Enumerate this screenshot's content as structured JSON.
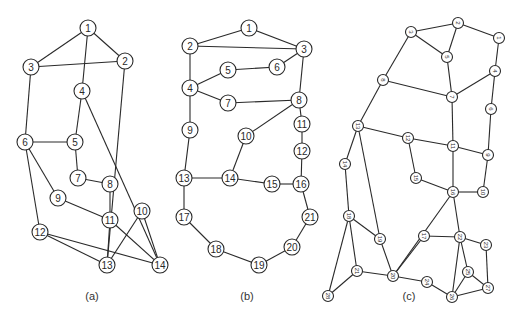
{
  "figure": {
    "panels": [
      {
        "id": "a",
        "caption": "(a)",
        "caption_pos": [
          92,
          300
        ],
        "node_radius": 8,
        "font_size": 10,
        "label_rotation": 0,
        "nodes": [
          {
            "id": "1",
            "x": 88,
            "y": 28
          },
          {
            "id": "2",
            "x": 125,
            "y": 61
          },
          {
            "id": "3",
            "x": 31,
            "y": 67
          },
          {
            "id": "4",
            "x": 82,
            "y": 91
          },
          {
            "id": "5",
            "x": 75,
            "y": 142
          },
          {
            "id": "6",
            "x": 25,
            "y": 142
          },
          {
            "id": "7",
            "x": 78,
            "y": 178
          },
          {
            "id": "8",
            "x": 110,
            "y": 184
          },
          {
            "id": "9",
            "x": 58,
            "y": 198
          },
          {
            "id": "10",
            "x": 142,
            "y": 211
          },
          {
            "id": "11",
            "x": 110,
            "y": 220
          },
          {
            "id": "12",
            "x": 40,
            "y": 232
          },
          {
            "id": "13",
            "x": 107,
            "y": 265
          },
          {
            "id": "14",
            "x": 160,
            "y": 265
          }
        ],
        "edges": [
          [
            "1",
            "3"
          ],
          [
            "1",
            "2"
          ],
          [
            "1",
            "4"
          ],
          [
            "3",
            "2"
          ],
          [
            "3",
            "6"
          ],
          [
            "2",
            "13"
          ],
          [
            "4",
            "5"
          ],
          [
            "4",
            "14"
          ],
          [
            "6",
            "5"
          ],
          [
            "6",
            "9"
          ],
          [
            "6",
            "12"
          ],
          [
            "5",
            "7"
          ],
          [
            "7",
            "8"
          ],
          [
            "8",
            "11"
          ],
          [
            "9",
            "11"
          ],
          [
            "11",
            "13"
          ],
          [
            "11",
            "14"
          ],
          [
            "10",
            "13"
          ],
          [
            "10",
            "14"
          ],
          [
            "12",
            "13"
          ],
          [
            "12",
            "14"
          ]
        ]
      },
      {
        "id": "b",
        "caption": "(b)",
        "caption_pos": [
          247,
          300
        ],
        "node_radius": 8,
        "font_size": 10,
        "label_rotation": 0,
        "nodes": [
          {
            "id": "1",
            "x": 249,
            "y": 28
          },
          {
            "id": "2",
            "x": 190,
            "y": 46
          },
          {
            "id": "3",
            "x": 304,
            "y": 49
          },
          {
            "id": "4",
            "x": 190,
            "y": 88
          },
          {
            "id": "5",
            "x": 228,
            "y": 70
          },
          {
            "id": "6",
            "x": 277,
            "y": 67
          },
          {
            "id": "7",
            "x": 228,
            "y": 103
          },
          {
            "id": "8",
            "x": 299,
            "y": 100
          },
          {
            "id": "9",
            "x": 190,
            "y": 130
          },
          {
            "id": "10",
            "x": 246,
            "y": 136
          },
          {
            "id": "11",
            "x": 302,
            "y": 124
          },
          {
            "id": "12",
            "x": 302,
            "y": 151
          },
          {
            "id": "13",
            "x": 184,
            "y": 178
          },
          {
            "id": "14",
            "x": 230,
            "y": 178
          },
          {
            "id": "15",
            "x": 272,
            "y": 184
          },
          {
            "id": "16",
            "x": 301,
            "y": 184
          },
          {
            "id": "17",
            "x": 184,
            "y": 217
          },
          {
            "id": "18",
            "x": 216,
            "y": 249
          },
          {
            "id": "19",
            "x": 259,
            "y": 265
          },
          {
            "id": "20",
            "x": 292,
            "y": 247
          },
          {
            "id": "21",
            "x": 310,
            "y": 217
          }
        ],
        "edges": [
          [
            "1",
            "2"
          ],
          [
            "1",
            "3"
          ],
          [
            "2",
            "3"
          ],
          [
            "2",
            "4"
          ],
          [
            "3",
            "6"
          ],
          [
            "3",
            "8"
          ],
          [
            "4",
            "5"
          ],
          [
            "4",
            "7"
          ],
          [
            "4",
            "9"
          ],
          [
            "5",
            "6"
          ],
          [
            "7",
            "8"
          ],
          [
            "8",
            "10"
          ],
          [
            "8",
            "11"
          ],
          [
            "11",
            "12"
          ],
          [
            "12",
            "16"
          ],
          [
            "9",
            "13"
          ],
          [
            "10",
            "14"
          ],
          [
            "13",
            "14"
          ],
          [
            "14",
            "15"
          ],
          [
            "15",
            "16"
          ],
          [
            "13",
            "17"
          ],
          [
            "16",
            "21"
          ],
          [
            "17",
            "18"
          ],
          [
            "18",
            "19"
          ],
          [
            "19",
            "20"
          ],
          [
            "20",
            "21"
          ]
        ]
      },
      {
        "id": "c",
        "caption": "(c)",
        "caption_pos": [
          409,
          300
        ],
        "node_radius": 5.5,
        "font_size": 6,
        "label_rotation": 90,
        "nodes": [
          {
            "id": "1",
            "x": 499,
            "y": 38
          },
          {
            "id": "2",
            "x": 458,
            "y": 23
          },
          {
            "id": "3",
            "x": 411,
            "y": 32
          },
          {
            "id": "4",
            "x": 495,
            "y": 71
          },
          {
            "id": "5",
            "x": 447,
            "y": 57
          },
          {
            "id": "6",
            "x": 491,
            "y": 109
          },
          {
            "id": "7",
            "x": 452,
            "y": 97
          },
          {
            "id": "8",
            "x": 383,
            "y": 80
          },
          {
            "id": "9",
            "x": 488,
            "y": 155
          },
          {
            "id": "10",
            "x": 483,
            "y": 192
          },
          {
            "id": "11",
            "x": 453,
            "y": 146
          },
          {
            "id": "12",
            "x": 408,
            "y": 138
          },
          {
            "id": "13",
            "x": 358,
            "y": 126
          },
          {
            "id": "14",
            "x": 345,
            "y": 164
          },
          {
            "id": "15",
            "x": 416,
            "y": 178
          },
          {
            "id": "16",
            "x": 453,
            "y": 192
          },
          {
            "id": "17",
            "x": 424,
            "y": 236
          },
          {
            "id": "18",
            "x": 349,
            "y": 216
          },
          {
            "id": "19",
            "x": 380,
            "y": 239
          },
          {
            "id": "20",
            "x": 393,
            "y": 276
          },
          {
            "id": "21",
            "x": 357,
            "y": 271
          },
          {
            "id": "22",
            "x": 460,
            "y": 237
          },
          {
            "id": "23",
            "x": 486,
            "y": 245
          },
          {
            "id": "24",
            "x": 427,
            "y": 282
          },
          {
            "id": "25",
            "x": 468,
            "y": 272
          },
          {
            "id": "26",
            "x": 452,
            "y": 297
          },
          {
            "id": "27",
            "x": 488,
            "y": 288
          },
          {
            "id": "28",
            "x": 328,
            "y": 296
          }
        ],
        "edges": [
          [
            "3",
            "2"
          ],
          [
            "2",
            "1"
          ],
          [
            "2",
            "5"
          ],
          [
            "3",
            "5"
          ],
          [
            "3",
            "8"
          ],
          [
            "1",
            "4"
          ],
          [
            "5",
            "7"
          ],
          [
            "4",
            "7"
          ],
          [
            "4",
            "6"
          ],
          [
            "8",
            "7"
          ],
          [
            "8",
            "13"
          ],
          [
            "7",
            "11"
          ],
          [
            "6",
            "9"
          ],
          [
            "13",
            "12"
          ],
          [
            "12",
            "11"
          ],
          [
            "11",
            "9"
          ],
          [
            "13",
            "14"
          ],
          [
            "13",
            "19"
          ],
          [
            "12",
            "15"
          ],
          [
            "11",
            "16"
          ],
          [
            "9",
            "10"
          ],
          [
            "15",
            "16"
          ],
          [
            "16",
            "10"
          ],
          [
            "16",
            "20"
          ],
          [
            "16",
            "22"
          ],
          [
            "14",
            "18"
          ],
          [
            "18",
            "19"
          ],
          [
            "18",
            "21"
          ],
          [
            "18",
            "28"
          ],
          [
            "19",
            "20"
          ],
          [
            "20",
            "17"
          ],
          [
            "17",
            "22"
          ],
          [
            "21",
            "20"
          ],
          [
            "21",
            "28"
          ],
          [
            "20",
            "24"
          ],
          [
            "24",
            "26"
          ],
          [
            "22",
            "23"
          ],
          [
            "22",
            "25"
          ],
          [
            "22",
            "26"
          ],
          [
            "25",
            "26"
          ],
          [
            "25",
            "27"
          ],
          [
            "23",
            "27"
          ],
          [
            "26",
            "27"
          ]
        ]
      }
    ]
  }
}
